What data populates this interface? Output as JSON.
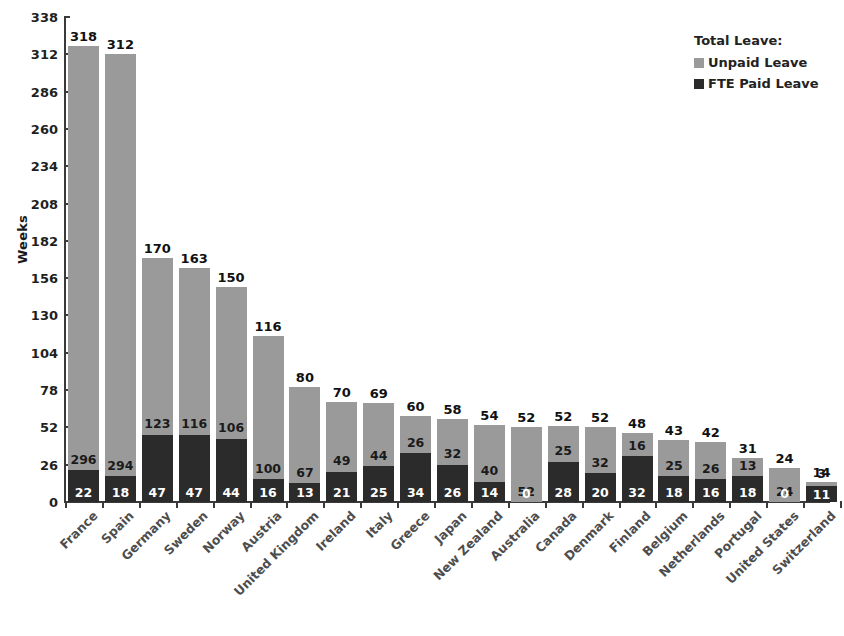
{
  "chart_data": {
    "type": "bar",
    "stacked": true,
    "title": "",
    "xlabel": "",
    "ylabel": "Weeks",
    "ylim": [
      0,
      338
    ],
    "yticks": [
      0,
      26,
      52,
      78,
      104,
      130,
      156,
      182,
      208,
      234,
      260,
      286,
      312,
      338
    ],
    "grid": false,
    "legend_position": "top-right",
    "legend_title": "Total Leave:",
    "categories": [
      "France",
      "Spain",
      "Germany",
      "Sweden",
      "Norway",
      "Austria",
      "United Kingdom",
      "Ireland",
      "Italy",
      "Greece",
      "Japan",
      "New Zealand",
      "Australia",
      "Canada",
      "Denmark",
      "Finland",
      "Belgium",
      "Netherlands",
      "Portugal",
      "United States",
      "Switzerland"
    ],
    "series": [
      {
        "name": "Unpaid Leave",
        "color": "#9a9a9a",
        "values": [
          296,
          294,
          123,
          116,
          106,
          100,
          67,
          49,
          44,
          26,
          32,
          40,
          52,
          25,
          32,
          16,
          25,
          26,
          13,
          24,
          3
        ]
      },
      {
        "name": "FTE Paid Leave",
        "color": "#2b2b2b",
        "values": [
          22,
          18,
          47,
          47,
          44,
          16,
          13,
          21,
          25,
          34,
          26,
          14,
          0,
          28,
          20,
          32,
          18,
          16,
          18,
          0,
          11
        ]
      }
    ],
    "totals": [
      318,
      312,
      170,
      163,
      150,
      116,
      80,
      70,
      69,
      60,
      58,
      54,
      52,
      52,
      52,
      48,
      43,
      42,
      31,
      24,
      14
    ]
  },
  "legend": {
    "title": "Total Leave:",
    "entries": [
      {
        "label": "Unpaid Leave",
        "color": "#9a9a9a",
        "swatch": "unpaid"
      },
      {
        "label": "FTE Paid Leave",
        "color": "#2b2b2b",
        "swatch": "paid"
      }
    ]
  },
  "axes": {
    "y_title": "Weeks"
  },
  "footnote": ""
}
